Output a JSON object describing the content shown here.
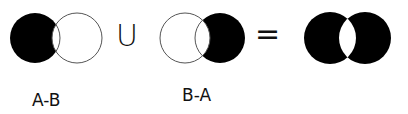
{
  "diagram": {
    "type": "venn-set-operation",
    "expression": "(A-B) U (B-A) = A △ B",
    "operators": {
      "union": "U",
      "equals": "="
    },
    "panels": [
      {
        "id": "a-minus-b",
        "label": "A-B",
        "shaded_region": "A only"
      },
      {
        "id": "b-minus-a",
        "label": "B-A",
        "shaded_region": "B only"
      },
      {
        "id": "result",
        "label": "",
        "shaded_region": "A and B excluding intersection"
      }
    ],
    "colors": {
      "fill": "#000000",
      "stroke": "#555555",
      "background": "#ffffff"
    }
  }
}
